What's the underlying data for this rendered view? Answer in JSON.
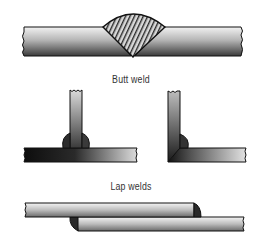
{
  "labels": {
    "butt_weld": "Butt weld",
    "lap_welds": "Lap welds"
  },
  "colors": {
    "outline": "#111111",
    "metal_dark": "#1a1a1a",
    "metal_light": "#e8e8e8",
    "label": "#333333"
  }
}
